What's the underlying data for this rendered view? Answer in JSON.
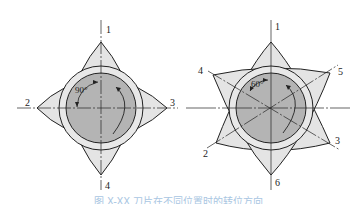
{
  "figure_left": {
    "labels": [
      "1",
      "2",
      "3",
      "4"
    ],
    "angle": "90°",
    "description": "square insert indexing positions"
  },
  "figure_right": {
    "labels": [
      "1",
      "2",
      "3",
      "4",
      "5",
      "6"
    ],
    "angle": "60°",
    "description": "triangular insert indexing positions"
  },
  "caption": "图 X-XX 刀片在不同位置时的转位方向",
  "colors": {
    "insert_fill": "#e4e4e4",
    "hub_fill": "#b4b4b4",
    "stroke": "#222222",
    "caption": "#a9c6e2"
  }
}
